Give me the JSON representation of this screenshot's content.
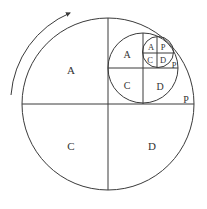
{
  "diagram": {
    "stroke_color": "#3a3a3a",
    "background": "#ffffff",
    "rotation_arrow": {
      "direction": "clockwise",
      "icon": "curved-arrow-icon"
    },
    "levels": [
      {
        "name": "outer",
        "labels": {
          "top_left": "A",
          "bottom_left": "C",
          "bottom_right": "D",
          "top_right_corner": "P"
        }
      },
      {
        "name": "middle",
        "labels": {
          "top_left": "A",
          "bottom_left": "C",
          "bottom_right": "D",
          "top_right_corner": "P"
        }
      },
      {
        "name": "inner",
        "labels": {
          "top_left": "A",
          "top_right": "P",
          "bottom_left": "C",
          "bottom_right": "D"
        }
      }
    ]
  }
}
